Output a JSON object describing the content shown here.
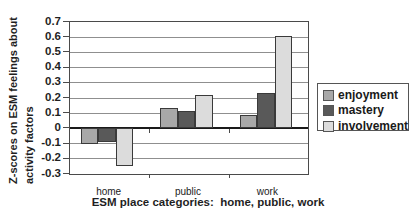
{
  "chart_data": {
    "type": "bar",
    "title": "",
    "categories": [
      "home",
      "public",
      "work"
    ],
    "series": [
      {
        "name": "enjoyment",
        "color": "#a8a8a8",
        "values": [
          -0.1,
          0.135,
          0.085
        ]
      },
      {
        "name": "mastery",
        "color": "#595959",
        "values": [
          -0.09,
          0.115,
          0.235
        ]
      },
      {
        "name": "involvement",
        "color": "#dcdcdc",
        "values": [
          -0.245,
          0.22,
          0.605
        ]
      }
    ],
    "xlabel": "ESM place categories:  home, public, work",
    "ylabel": "Z-scores on ESM feelings about activity factors",
    "ylabel_line1": "Z-scores on ESM feelings about",
    "ylabel_line2": "activity factors",
    "ylim": [
      -0.3,
      0.7
    ],
    "yticks": [
      "0.7",
      "0.6",
      "0.5",
      "0.4",
      "0.3",
      "0.2",
      "0.1",
      "0",
      "-0.1",
      "-0.2",
      "-0.3"
    ],
    "grid": true,
    "legend_position": "right",
    "colors": {
      "background": "#ffffff",
      "gridline": "#8f8f8f",
      "zero_line": "#1a1a1a",
      "axis": "#4a4a4a",
      "text": "#1f1f1f",
      "bar_border": "#3a3a3a"
    }
  }
}
